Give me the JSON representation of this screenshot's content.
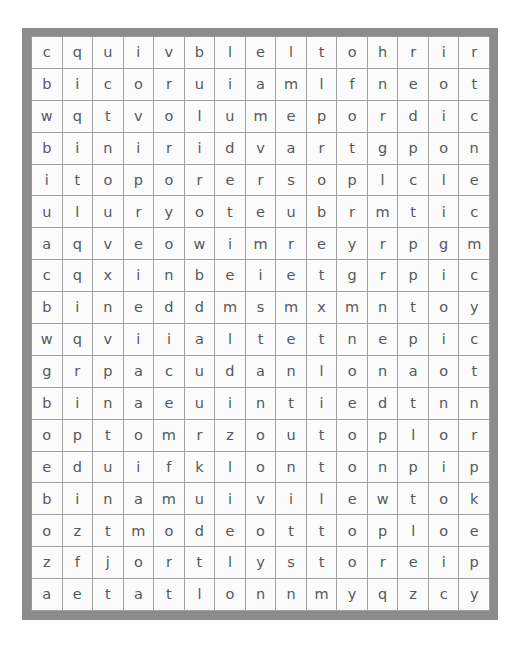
{
  "puzzle": {
    "type": "word-search",
    "rows": 18,
    "columns": 15,
    "frame_color": "#8c8c8c",
    "cell_background": "#fbfbfb",
    "cell_border_color": "#a2a2a2",
    "letter_color": "#55585c",
    "grid": [
      [
        "c",
        "q",
        "u",
        "i",
        "v",
        "b",
        "l",
        "e",
        "l",
        "t",
        "o",
        "h",
        "r",
        "i",
        "r"
      ],
      [
        "b",
        "i",
        "c",
        "o",
        "r",
        "u",
        "i",
        "a",
        "m",
        "l",
        "f",
        "n",
        "e",
        "o",
        "t"
      ],
      [
        "w",
        "q",
        "t",
        "v",
        "o",
        "l",
        "u",
        "m",
        "e",
        "p",
        "o",
        "r",
        "d",
        "i",
        "c"
      ],
      [
        "b",
        "i",
        "n",
        "i",
        "r",
        "i",
        "d",
        "v",
        "a",
        "r",
        "t",
        "g",
        "p",
        "o",
        "n"
      ],
      [
        "i",
        "t",
        "o",
        "p",
        "o",
        "r",
        "e",
        "r",
        "s",
        "o",
        "p",
        "l",
        "c",
        "l",
        "e"
      ],
      [
        "u",
        "l",
        "u",
        "r",
        "y",
        "o",
        "t",
        "e",
        "u",
        "b",
        "r",
        "m",
        "t",
        "i",
        "c"
      ],
      [
        "a",
        "q",
        "v",
        "e",
        "o",
        "w",
        "i",
        "m",
        "r",
        "e",
        "y",
        "r",
        "p",
        "g",
        "m"
      ],
      [
        "c",
        "q",
        "x",
        "i",
        "n",
        "b",
        "e",
        "i",
        "e",
        "t",
        "g",
        "r",
        "p",
        "i",
        "c"
      ],
      [
        "b",
        "i",
        "n",
        "e",
        "d",
        "d",
        "m",
        "s",
        "m",
        "x",
        "m",
        "n",
        "t",
        "o",
        "y"
      ],
      [
        "w",
        "q",
        "v",
        "i",
        "i",
        "a",
        "l",
        "t",
        "e",
        "t",
        "n",
        "e",
        "p",
        "i",
        "c"
      ],
      [
        "g",
        "r",
        "p",
        "a",
        "c",
        "u",
        "d",
        "a",
        "n",
        "l",
        "o",
        "n",
        "a",
        "o",
        "t"
      ],
      [
        "b",
        "i",
        "n",
        "a",
        "e",
        "u",
        "i",
        "n",
        "t",
        "i",
        "e",
        "d",
        "t",
        "n",
        "n"
      ],
      [
        "o",
        "p",
        "t",
        "o",
        "m",
        "r",
        "z",
        "o",
        "u",
        "t",
        "o",
        "p",
        "l",
        "o",
        "r"
      ],
      [
        "e",
        "d",
        "u",
        "i",
        "f",
        "k",
        "l",
        "o",
        "n",
        "t",
        "o",
        "n",
        "p",
        "i",
        "p"
      ],
      [
        "b",
        "i",
        "n",
        "a",
        "m",
        "u",
        "i",
        "v",
        "i",
        "l",
        "e",
        "w",
        "t",
        "o",
        "k"
      ],
      [
        "o",
        "z",
        "t",
        "m",
        "o",
        "d",
        "e",
        "o",
        "t",
        "t",
        "o",
        "p",
        "l",
        "o",
        "e"
      ],
      [
        "z",
        "f",
        "j",
        "o",
        "r",
        "t",
        "l",
        "y",
        "s",
        "t",
        "o",
        "r",
        "e",
        "i",
        "p"
      ],
      [
        "a",
        "e",
        "t",
        "a",
        "t",
        "l",
        "o",
        "n",
        "n",
        "m",
        "y",
        "q",
        "z",
        "c",
        "y"
      ]
    ]
  }
}
